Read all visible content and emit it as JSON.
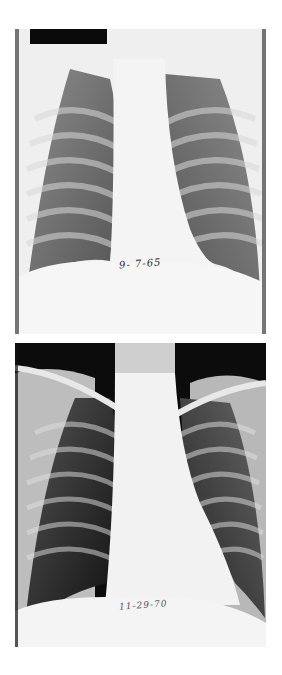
{
  "figure": {
    "panels": [
      {
        "id": "xray1",
        "description": "Frontal chest radiograph, earlier study",
        "handwritten_date": "9- 7-65",
        "redaction_bar": true
      },
      {
        "id": "xray2",
        "description": "Frontal chest radiograph, later study showing enlarged cardiac silhouette",
        "handwritten_date": "11-29-70",
        "redaction_bar": false
      }
    ]
  }
}
